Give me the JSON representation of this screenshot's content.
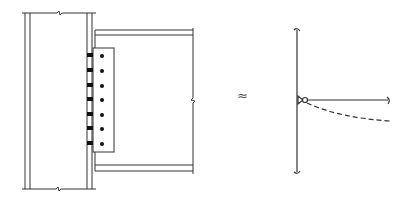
{
  "figure": {
    "equivalence_symbol": "≈",
    "colors": {
      "line": "#333333",
      "weld": "#111111",
      "bolt": "#111111",
      "background": "#ffffff"
    }
  },
  "connection_detail": {
    "column": {
      "outer_left_x": 25,
      "inner_left_x": 30,
      "inner_right_x": 87,
      "outer_right_x": 92,
      "top_y": 13,
      "bottom_y": 189
    },
    "beam": {
      "start_x": 95,
      "end_x": 193,
      "top_flange_y": [
        30,
        35
      ],
      "bottom_flange_y": [
        165,
        171
      ]
    },
    "shear_plate": {
      "x": 93,
      "y": 48,
      "width": 21,
      "height": 104
    },
    "bolts": {
      "count": 7,
      "x": 102,
      "y": [
        56,
        71,
        86,
        100,
        115,
        129,
        144
      ]
    },
    "welds": {
      "count": 7,
      "x": 88,
      "y": [
        55,
        70,
        85,
        99,
        114,
        128,
        143
      ]
    }
  },
  "structural_model": {
    "column_line": {
      "x": 297,
      "top_y": 30,
      "bottom_y": 172
    },
    "pin": {
      "x": 305,
      "y": 100
    },
    "beam_line": {
      "start_x": 305,
      "end_x": 388,
      "y": 100
    },
    "deflected_shape": {
      "style": "dashed",
      "end": [
        390,
        121
      ]
    }
  }
}
